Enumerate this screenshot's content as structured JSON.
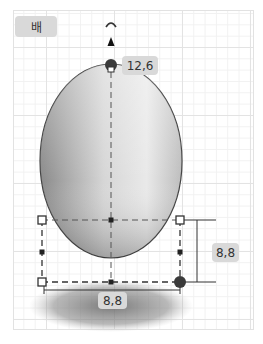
{
  "shape": {
    "name": "배",
    "type": "ellipsoid"
  },
  "dimensions": {
    "height": "12,6",
    "width": "8,8",
    "depth": "8,8"
  },
  "icons": {
    "rotate": "rotate-icon",
    "move_up": "arrow-up-icon"
  },
  "colors": {
    "grid_major": "#e3e3e3",
    "grid_minor": "#f1f1f1",
    "label_bg": "#d9d9d9",
    "handle": "#333333"
  }
}
